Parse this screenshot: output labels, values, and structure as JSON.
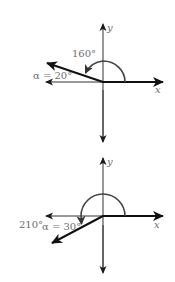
{
  "diagrams": [
    {
      "name": "angle-160",
      "axis_x_label": "x",
      "axis_y_label": "y",
      "angle_label": "160°",
      "reference_label": "α = 20°",
      "angle_degrees": 160,
      "reference_angle_degrees": 20
    },
    {
      "name": "angle-210",
      "axis_x_label": "x",
      "axis_y_label": "y",
      "angle_label": "210°",
      "reference_label": "α = 30°",
      "angle_degrees": 210,
      "reference_angle_degrees": 30
    }
  ],
  "colors": {
    "axis": "#333333",
    "ray": "#111111",
    "arc": "#444444",
    "label": "#6e6e6e"
  }
}
